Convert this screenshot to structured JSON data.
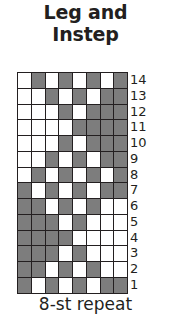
{
  "chart": {
    "title_lines": [
      "Leg and",
      "Instep"
    ],
    "caption": "8-st repeat",
    "colors": {
      "light_stitch": "#ffffff",
      "dark_stitch": "#7d7d7d",
      "grid_line": "#231f20",
      "text": "#231f20",
      "background": "#ffffff"
    }
  },
  "chart_data": {
    "type": "heatmap",
    "title": "Leg and Instep",
    "subtitle": "8-st repeat",
    "xlabel": "",
    "ylabel": "",
    "stitch_count": 8,
    "row_count": 14,
    "legend": [
      {
        "key": "light",
        "label": "main color",
        "color": "#ffffff",
        "value": 0
      },
      {
        "key": "dark",
        "label": "contrast color",
        "color": "#7d7d7d",
        "value": 1
      }
    ],
    "row_labels": [
      "14",
      "13",
      "12",
      "11",
      "10",
      "9",
      "8",
      "7",
      "6",
      "5",
      "4",
      "3",
      "2",
      "1"
    ],
    "column_labels": [
      "1",
      "2",
      "3",
      "4",
      "5",
      "6",
      "7",
      "8"
    ],
    "grid": true,
    "legend_position": "none",
    "note": "rows listed top to bottom = row 14 down to row 1; 1 = dark contrast stitch, 0 = light main stitch",
    "rows": [
      {
        "row": 14,
        "cells": [
          0,
          1,
          0,
          1,
          0,
          1,
          0,
          1
        ]
      },
      {
        "row": 13,
        "cells": [
          0,
          0,
          1,
          0,
          1,
          0,
          1,
          1
        ]
      },
      {
        "row": 12,
        "cells": [
          0,
          0,
          0,
          1,
          0,
          1,
          1,
          1
        ]
      },
      {
        "row": 11,
        "cells": [
          0,
          0,
          0,
          0,
          1,
          1,
          1,
          1
        ]
      },
      {
        "row": 10,
        "cells": [
          0,
          0,
          0,
          1,
          0,
          1,
          1,
          1
        ]
      },
      {
        "row": 9,
        "cells": [
          0,
          0,
          1,
          0,
          1,
          0,
          1,
          1
        ]
      },
      {
        "row": 8,
        "cells": [
          0,
          1,
          0,
          1,
          0,
          1,
          0,
          1
        ]
      },
      {
        "row": 7,
        "cells": [
          1,
          0,
          1,
          0,
          1,
          0,
          1,
          1
        ]
      },
      {
        "row": 6,
        "cells": [
          1,
          1,
          0,
          1,
          0,
          1,
          0,
          0
        ]
      },
      {
        "row": 5,
        "cells": [
          1,
          1,
          1,
          0,
          1,
          0,
          0,
          0
        ]
      },
      {
        "row": 4,
        "cells": [
          1,
          1,
          1,
          1,
          0,
          0,
          0,
          0
        ]
      },
      {
        "row": 3,
        "cells": [
          1,
          1,
          1,
          0,
          1,
          0,
          0,
          0
        ]
      },
      {
        "row": 2,
        "cells": [
          1,
          1,
          0,
          1,
          0,
          1,
          0,
          0
        ]
      },
      {
        "row": 1,
        "cells": [
          1,
          0,
          1,
          0,
          1,
          0,
          1,
          1
        ]
      }
    ]
  }
}
